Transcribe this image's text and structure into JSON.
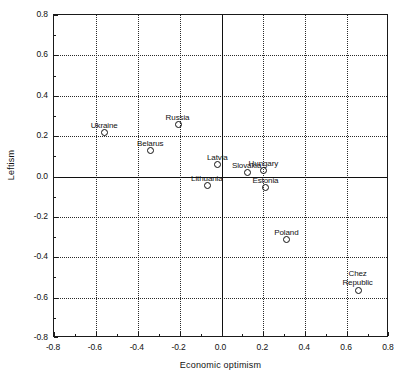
{
  "chart_data": {
    "type": "scatter",
    "title": "",
    "xlabel": "Economic optimism",
    "ylabel": "Leftism",
    "xlim": [
      -0.8,
      0.8
    ],
    "ylim": [
      -0.8,
      0.8
    ],
    "grid": true,
    "legend": "none",
    "xticks": [
      "-0.8",
      "-0.6",
      "-0.4",
      "-0.2",
      "0.0",
      "0.2",
      "0.4",
      "0.6",
      "0.8"
    ],
    "xtick_values": [
      -0.8,
      -0.6,
      -0.4,
      -0.2,
      0.0,
      0.2,
      0.4,
      0.6,
      0.8
    ],
    "yticks": [
      "0.8",
      "0.6",
      "0.4",
      "0.2",
      "0.0",
      "-0.2",
      "-0.4",
      "-0.6",
      "-0.8"
    ],
    "ytick_values": [
      0.8,
      0.6,
      0.4,
      0.2,
      0.0,
      -0.2,
      -0.4,
      -0.6,
      -0.8
    ],
    "points": [
      {
        "label": "Ukraine",
        "x": -0.56,
        "y": 0.22,
        "label_pos": "above"
      },
      {
        "label": "Russia",
        "x": -0.21,
        "y": 0.26,
        "label_pos": "above"
      },
      {
        "label": "Belarus",
        "x": -0.34,
        "y": 0.13,
        "label_pos": "above"
      },
      {
        "label": "Latvia",
        "x": -0.02,
        "y": 0.06,
        "label_pos": "above"
      },
      {
        "label": "Lithuania",
        "x": -0.07,
        "y": -0.04,
        "label_pos": "above"
      },
      {
        "label": "Slovakia",
        "x": 0.12,
        "y": 0.02,
        "label_pos": "above"
      },
      {
        "label": "Hungary",
        "x": 0.2,
        "y": 0.03,
        "label_pos": "above"
      },
      {
        "label": "Estonia",
        "x": 0.21,
        "y": -0.05,
        "label_pos": "above"
      },
      {
        "label": "Poland",
        "x": 0.31,
        "y": -0.31,
        "label_pos": "above"
      },
      {
        "label": "Chez Republic",
        "x": 0.65,
        "y": -0.56,
        "label_pos": "above-two-line"
      }
    ]
  },
  "colors": {
    "axis": "#111111",
    "grid": "#2a2a2a",
    "marker": "#111111",
    "background": "#ffffff"
  }
}
